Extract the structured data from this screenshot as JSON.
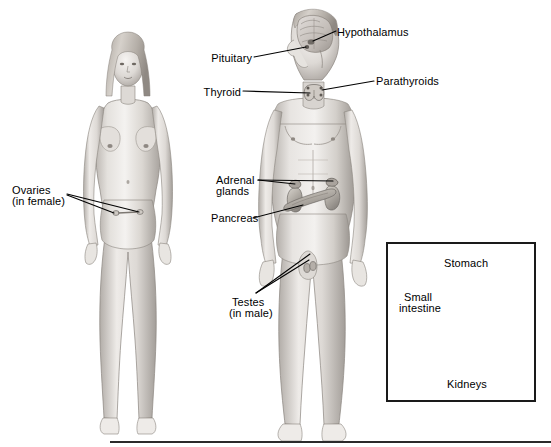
{
  "figure": {
    "background_color": "#ffffff",
    "ink_color": "#000000",
    "width": 551,
    "height": 447
  },
  "figures": {
    "female": {
      "name": "female-body-figure",
      "caption_group": "Ovaries (in female)"
    },
    "male": {
      "name": "male-body-figure",
      "caption_group": "Testes (in male)"
    }
  },
  "labels": {
    "hypothalamus": {
      "text": "Hypothalamus",
      "x": 337,
      "y": 27,
      "align": "left"
    },
    "pituitary": {
      "text": "Pituitary",
      "x": 222,
      "y": 53,
      "align": "right"
    },
    "parathyroids": {
      "text": "Parathyroids",
      "x": 376,
      "y": 76,
      "align": "left"
    },
    "thyroid": {
      "text": "Thyroid",
      "x": 212,
      "y": 87,
      "align": "right"
    },
    "ovaries_line1": {
      "text": "Ovaries",
      "x": 12,
      "y": 185,
      "align": "left"
    },
    "ovaries_line2": {
      "text": "(in female)",
      "x": 12,
      "y": 196,
      "align": "left"
    },
    "adrenal_line1": {
      "text": "Adrenal",
      "x": 216,
      "y": 175,
      "align": "left"
    },
    "adrenal_line2": {
      "text": "glands",
      "x": 216,
      "y": 186,
      "align": "left"
    },
    "pancreas": {
      "text": "Pancreas",
      "x": 211,
      "y": 213,
      "align": "left"
    },
    "testes_line1": {
      "text": "Testes",
      "x": 232,
      "y": 297,
      "align": "left"
    },
    "testes_line2": {
      "text": "(in male)",
      "x": 229,
      "y": 308,
      "align": "left"
    },
    "stomach": {
      "text": "Stomach",
      "x": 444,
      "y": 258,
      "align": "left"
    },
    "small_intestine_line1": {
      "text": "Small",
      "x": 404,
      "y": 292,
      "align": "left"
    },
    "small_intestine_line2": {
      "text": "intestine",
      "x": 399,
      "y": 303,
      "align": "left"
    },
    "kidneys": {
      "text": "Kidneys",
      "x": 447,
      "y": 379,
      "align": "left"
    }
  },
  "inset": {
    "name": "organs-inset-panel",
    "x": 386,
    "y": 242,
    "width": 150,
    "height": 160,
    "border_color": "#1a1a1a",
    "organs": [
      "Stomach",
      "Small intestine",
      "Kidneys"
    ]
  },
  "baseline": {
    "x": 110,
    "y": 441,
    "width": 441,
    "height": 2,
    "color": "#2b2b2b"
  },
  "colors": {
    "skin_light": "#f2f0ee",
    "skin_mid": "#d8d4d0",
    "skin_shadow": "#a9a4a0",
    "hair": "#b8b2ac",
    "organ_fill": "#b9b4ae",
    "organ_dark": "#8d8881",
    "organ_light": "#ddd9d3",
    "outline": "#6e6a66",
    "leader_line": "#000000"
  },
  "callouts": [
    {
      "id": "hypothalamus",
      "label": "Hypothalamus",
      "target": "hypothalamus-gland"
    },
    {
      "id": "pituitary",
      "label": "Pituitary",
      "target": "pituitary-gland"
    },
    {
      "id": "parathyroids",
      "label": "Parathyroids",
      "target": "parathyroid-glands"
    },
    {
      "id": "thyroid",
      "label": "Thyroid",
      "target": "thyroid-gland"
    },
    {
      "id": "ovaries",
      "label": "Ovaries (in female)",
      "target": "ovaries"
    },
    {
      "id": "adrenal",
      "label": "Adrenal glands",
      "target": "adrenal-glands"
    },
    {
      "id": "pancreas",
      "label": "Pancreas",
      "target": "pancreas"
    },
    {
      "id": "testes",
      "label": "Testes (in male)",
      "target": "testes"
    },
    {
      "id": "stomach",
      "label": "Stomach",
      "target": "stomach"
    },
    {
      "id": "small_intestine",
      "label": "Small intestine",
      "target": "small-intestine"
    },
    {
      "id": "kidneys",
      "label": "Kidneys",
      "target": "kidneys"
    }
  ]
}
